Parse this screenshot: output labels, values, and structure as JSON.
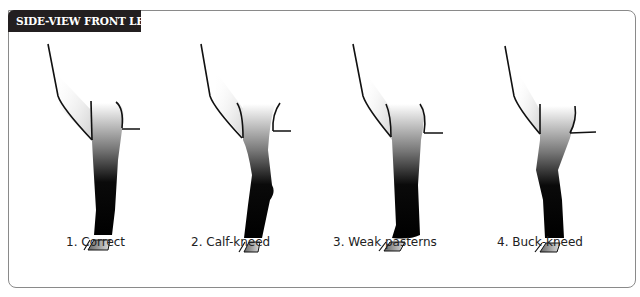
{
  "title": "SIDE-VIEW FRONT LEGS",
  "colors": {
    "tab_bg": "#231f20",
    "frame": "#8a8a8a",
    "leg_dark": "#0a0a0a"
  },
  "legs": [
    {
      "number": "1.",
      "name": "Correct",
      "label": "1.  Correct"
    },
    {
      "number": "2.",
      "name": "Calf-kneed",
      "label": "2.  Calf-kneed"
    },
    {
      "number": "3.",
      "name": "Weak pasterns",
      "label": "3.  Weak pasterns"
    },
    {
      "number": "4.",
      "name": "Buck-kneed",
      "label": "4.  Buck-kneed"
    }
  ]
}
